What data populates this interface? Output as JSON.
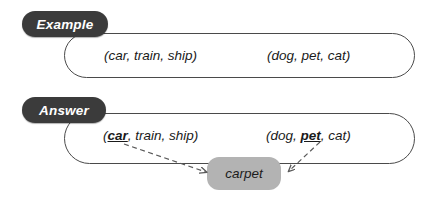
{
  "figure": {
    "background_color": "#ffffff",
    "badge_color": "#3b3b3b",
    "badge_text_color": "#ffffff",
    "panel_border_color": "#4a4a4a",
    "chip_color": "#b3b3b3",
    "arrow_color": "#5a5a5a"
  },
  "example": {
    "badge_label": "Example",
    "left_phrase": "(car, train, ship)",
    "right_phrase": "(dog, pet, cat)"
  },
  "answer": {
    "badge_label": "Answer",
    "left_phrase": {
      "open": "(",
      "highlight": "car",
      "rest": ", train, ship)"
    },
    "right_phrase": {
      "open": "(dog, ",
      "highlight": "pet",
      "rest": ", cat)"
    },
    "result_chip_label": "carpet",
    "arrows": [
      {
        "name": "left-arrow",
        "from": "car",
        "to": "carpet",
        "style": "dashed"
      },
      {
        "name": "right-arrow",
        "from": "pet",
        "to": "carpet",
        "style": "dashed"
      }
    ]
  }
}
